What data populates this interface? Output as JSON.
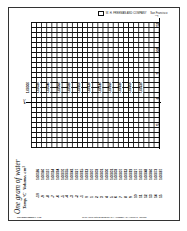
{
  "header": {
    "publisher": "W. H. FREEMAN AND COMPANY",
    "city": "San Francisco"
  },
  "graph": {
    "vertical_axis_label": "T",
    "horizontal_axis_label": "V",
    "temperature_ticks": [
      "15",
      "10",
      "5",
      "0",
      "-5"
    ],
    "volume_ticks": [
      "1.00000",
      "1.00020",
      "1.00040",
      "1.00060",
      "1.00080",
      "1.00100",
      "1.00120",
      "1.00140",
      "1.00160",
      "1.00180",
      "1.00200",
      "1.00220"
    ]
  },
  "table": {
    "title": "One gram of water",
    "temp_header": "Temp,°C",
    "volume_header": "Volume, cm³",
    "temps": [
      "-10",
      "-9",
      "-8",
      "-7",
      "-6",
      "-5",
      "-4",
      "-3",
      "-2",
      "-1",
      "0",
      "1",
      "2",
      "3",
      "4",
      "5",
      "6",
      "7",
      "8",
      "9",
      "10",
      "11",
      "12",
      "13",
      "14",
      "15"
    ],
    "volumes": [
      "1.00186",
      "1.00160",
      "1.00137",
      "1.00114",
      "1.00094",
      "1.00070",
      "1.00055",
      "1.00041",
      "1.00027",
      "1.00015",
      "1.00013",
      "1.00007",
      "1.00003",
      "1.00001",
      "1.00000",
      "1.00001",
      "1.00003",
      "1.00007",
      "1.00012",
      "1.00019",
      "1.00027",
      "1.00037",
      "1.00048",
      "1.00060",
      "1.00073",
      "1.00087"
    ]
  },
  "footer": {
    "left": "TRANSPARENCY 4-16",
    "right": "To be used with ELEMENTARY ALGEBRA by Harold R. Jacobs"
  }
}
